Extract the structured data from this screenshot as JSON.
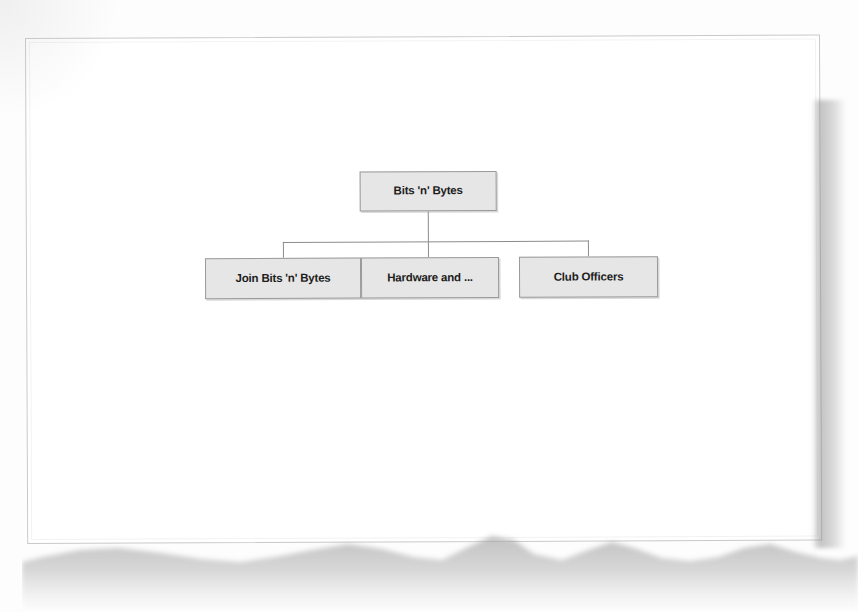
{
  "document": {
    "kind": "scanned-page",
    "background_color": "#fdfdfd",
    "page_color": "#ffffff",
    "page_border_color": "#c9c9c9"
  },
  "diagram": {
    "type": "site-map-tree",
    "node_fill_color": "#e6e6e6",
    "node_border_color": "#9a9a9a",
    "connector_color": "#8c8c8c",
    "root": {
      "label": "Bits 'n' Bytes"
    },
    "children": [
      {
        "label": "Join Bits 'n' Bytes"
      },
      {
        "label": "Hardware and ..."
      },
      {
        "label": "Club Officers"
      }
    ]
  }
}
